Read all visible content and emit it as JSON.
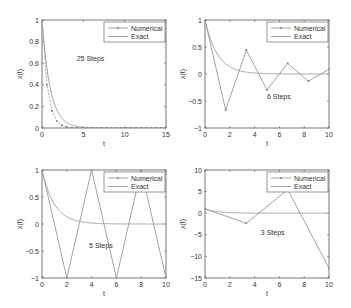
{
  "figure": {
    "width": 351,
    "height": 308,
    "line_color": "#9a9a9a",
    "axis_color": "#555555",
    "text_color": "#333333"
  },
  "legend": {
    "numerical_label": "Numerical",
    "exact_label": "Exact"
  },
  "chart_data": [
    {
      "type": "line",
      "title": "",
      "annotation": "25 Steps",
      "xlabel": "t",
      "ylabel": "x(t)",
      "xlim": [
        0,
        15
      ],
      "ylim": [
        0,
        1
      ],
      "xticks": [
        0,
        5,
        10,
        15
      ],
      "yticks": [
        0,
        0.2,
        0.4,
        0.6,
        0.8,
        1
      ],
      "ytick_labels": [
        "0",
        "0.2",
        "0.4",
        "0.6",
        "0.8",
        "1"
      ],
      "grid": false,
      "legend_position": "upper right",
      "box": [
        42,
        20,
        166,
        128
      ],
      "annot_pos": [
        0.28,
        0.62
      ],
      "steps": 25,
      "t_end": 15,
      "series": [
        {
          "name": "Numerical",
          "x": [
            0,
            0.6,
            1.2,
            1.8,
            2.4,
            3.0,
            3.6,
            4.2,
            4.8,
            5.4,
            6.0,
            6.6,
            7.2,
            7.8,
            8.4,
            9.0,
            9.6,
            10.2,
            10.8,
            11.4,
            12.0,
            12.6,
            13.2,
            13.8,
            14.4,
            15.0
          ],
          "y": [
            1,
            0.4,
            0.16,
            0.064,
            0.0256,
            0.0102,
            0.0041,
            0.0016,
            0.0007,
            0.0003,
            0.0001,
            0,
            0,
            0,
            0,
            0,
            0,
            0,
            0,
            0,
            0,
            0,
            0,
            0,
            0,
            0
          ]
        },
        {
          "name": "Exact",
          "function": "exp(-t)"
        }
      ]
    },
    {
      "type": "line",
      "title": "",
      "annotation": "6 Steps",
      "xlabel": "t",
      "ylabel": "x(t)",
      "xlim": [
        0,
        10
      ],
      "ylim": [
        -1,
        1
      ],
      "xticks": [
        0,
        2,
        4,
        6,
        8,
        10
      ],
      "yticks": [
        -1,
        -0.5,
        0,
        0.5,
        1
      ],
      "ytick_labels": [
        "-1",
        "-0.5",
        "0",
        "0.5",
        "1"
      ],
      "grid": false,
      "legend_position": "upper right",
      "box": [
        205,
        20,
        329,
        128
      ],
      "annot_pos": [
        0.5,
        0.27
      ],
      "steps": 6,
      "t_end": 10,
      "series": [
        {
          "name": "Numerical",
          "x": [
            0,
            1.667,
            3.333,
            5.0,
            6.667,
            8.333,
            10.0
          ],
          "y": [
            1,
            -0.667,
            0.444,
            -0.296,
            0.198,
            -0.132,
            0.088
          ]
        },
        {
          "name": "Exact",
          "function": "exp(-t)"
        }
      ]
    },
    {
      "type": "line",
      "title": "",
      "annotation": "5 Steps",
      "xlabel": "t",
      "ylabel": "x(t)",
      "xlim": [
        0,
        10
      ],
      "ylim": [
        -1,
        1
      ],
      "xticks": [
        0,
        2,
        4,
        6,
        8,
        10
      ],
      "yticks": [
        -1,
        -0.5,
        0,
        0.5,
        1
      ],
      "ytick_labels": [
        "-1",
        "-0.5",
        "0",
        "0.5",
        "1"
      ],
      "grid": false,
      "legend_position": "upper right",
      "box": [
        42,
        170,
        166,
        278
      ],
      "annot_pos": [
        0.38,
        0.28
      ],
      "steps": 5,
      "t_end": 10,
      "series": [
        {
          "name": "Numerical",
          "x": [
            0,
            2,
            4,
            6,
            8,
            10
          ],
          "y": [
            1,
            -1,
            1,
            -1,
            1,
            -1
          ]
        },
        {
          "name": "Exact",
          "function": "exp(-t)"
        }
      ]
    },
    {
      "type": "line",
      "title": "",
      "annotation": "3 Steps",
      "xlabel": "t",
      "ylabel": "x(t)",
      "xlim": [
        0,
        10
      ],
      "ylim": [
        -15,
        10
      ],
      "xticks": [
        0,
        2,
        4,
        6,
        8,
        10
      ],
      "yticks": [
        -15,
        -10,
        -5,
        0,
        5,
        10
      ],
      "ytick_labels": [
        "-15",
        "-10",
        "-5",
        "0",
        "5",
        "10"
      ],
      "grid": false,
      "legend_position": "upper right",
      "box": [
        205,
        170,
        329,
        278
      ],
      "annot_pos": [
        0.45,
        0.4
      ],
      "steps": 3,
      "t_end": 10,
      "series": [
        {
          "name": "Numerical",
          "x": [
            0,
            3.333,
            6.667,
            10.0
          ],
          "y": [
            1,
            -2.333,
            5.444,
            -12.704
          ]
        },
        {
          "name": "Exact",
          "function": "exp(-t)"
        }
      ]
    }
  ]
}
